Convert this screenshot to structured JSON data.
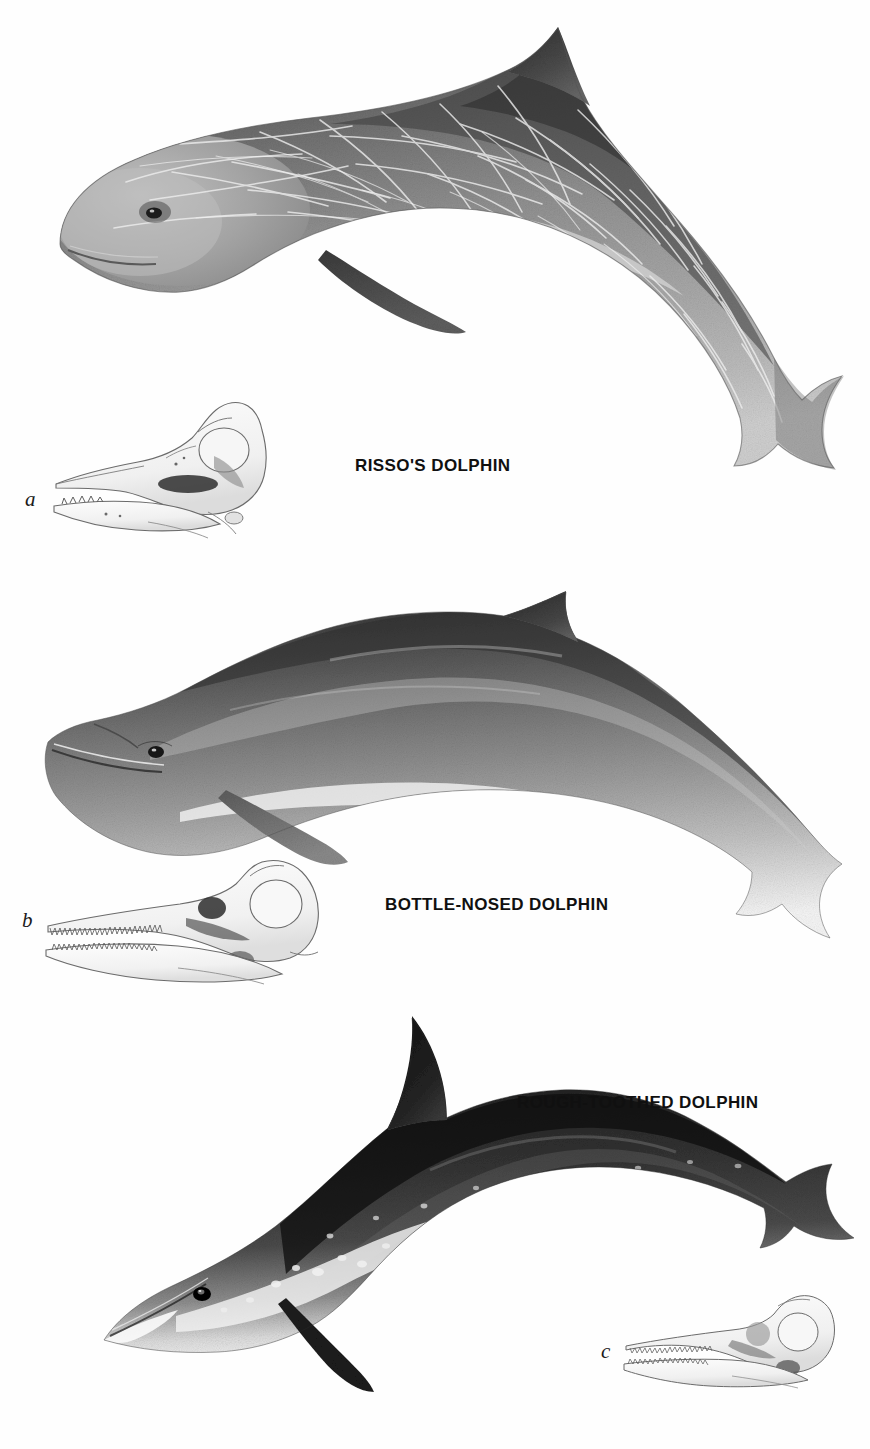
{
  "plate": {
    "title": "Dolphin identification plate",
    "background_color": "#fefefe",
    "ink_color": "#101010",
    "width": 870,
    "height": 1449
  },
  "species": [
    {
      "id": "rissos-dolphin",
      "label": "RISSO'S DOLPHIN",
      "label_x": 355,
      "label_y": 456,
      "skull_key": "a",
      "skull_key_x": 25,
      "skull_key_y": 487,
      "description": "Robust grey dolphin covered in white linear scarring, blunt head with no beak, tall falcate dorsal fin, pale anchor-shaped chest patch.",
      "body_tone": "#9a9a9a",
      "scarring": "dense white criss-cross scratches",
      "skull_teeth": "few peg-like teeth at tip of lower jaw only"
    },
    {
      "id": "bottle-nosed-dolphin",
      "label": "BOTTLE-NOSED DOLPHIN",
      "label_x": 385,
      "label_y": 895,
      "skull_key": "b",
      "skull_key_x": 22,
      "skull_key_y": 908,
      "description": "Uniform dark grey above fading to pale grey flanks and white belly, short stubby beak set off by a crease, tall curved dorsal fin.",
      "body_tone": "#6e6e6e",
      "scarring": "none",
      "skull_teeth": "numerous conical teeth along both jaws"
    },
    {
      "id": "rough-toothed-dolphin",
      "label": "ROUGH-TOOTHED DOLPHIN",
      "label_x": 517,
      "label_y": 1093,
      "skull_key": "c",
      "skull_key_x": 601,
      "skull_key_y": 1339,
      "description": "Very dark, almost black dolphin flecked with white spots, long slender beak blending smoothly into the forehead with no crease, white lips and throat.",
      "body_tone": "#2c2c2c",
      "scarring": "scattered white blotches and spots",
      "skull_teeth": "long rostrum with many fine ridged teeth in both jaws"
    }
  ]
}
